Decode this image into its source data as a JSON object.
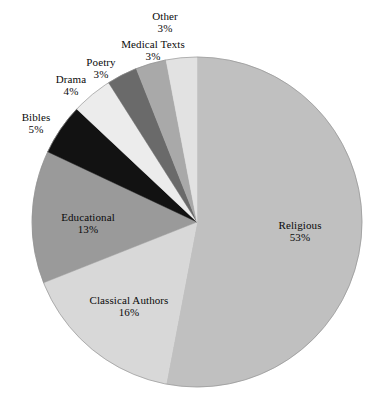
{
  "chart_data": {
    "type": "pie",
    "title": "",
    "subtitle": "",
    "xlabel": "",
    "ylabel": "",
    "legend_position": "none",
    "grid": false,
    "labels_show_percent": true,
    "start_angle_deg": 0,
    "direction": "clockwise",
    "categories": [
      "Religious",
      "Classical Authors",
      "Educational",
      "Bibles",
      "Drama",
      "Poetry",
      "Medical Texts",
      "Other"
    ],
    "values": [
      53,
      16,
      13,
      5,
      4,
      3,
      3,
      3
    ],
    "value_labels": [
      "53%",
      "16%",
      "13%",
      "5%",
      "4%",
      "3%",
      "3%",
      "3%"
    ],
    "colors": [
      "#c0c0c0",
      "#d8d8d8",
      "#9a9a9a",
      "#121212",
      "#ececec",
      "#6a6a6a",
      "#a9a9a9",
      "#e2e2e2"
    ],
    "slices": [
      {
        "name": "Religious",
        "value": 53,
        "value_label": "53%",
        "color": "#c0c0c0"
      },
      {
        "name": "Classical Authors",
        "value": 16,
        "value_label": "16%",
        "color": "#d8d8d8"
      },
      {
        "name": "Educational",
        "value": 13,
        "value_label": "13%",
        "color": "#9a9a9a"
      },
      {
        "name": "Bibles",
        "value": 5,
        "value_label": "5%",
        "color": "#121212"
      },
      {
        "name": "Drama",
        "value": 4,
        "value_label": "4%",
        "color": "#ececec"
      },
      {
        "name": "Poetry",
        "value": 3,
        "value_label": "3%",
        "color": "#6a6a6a"
      },
      {
        "name": "Medical Texts",
        "value": 3,
        "value_label": "3%",
        "color": "#a9a9a9"
      },
      {
        "name": "Other",
        "value": 3,
        "value_label": "3%",
        "color": "#e2e2e2"
      }
    ]
  },
  "geometry": {
    "center_x": 197,
    "center_y": 222,
    "radius": 165,
    "outline_color": "#8a8a8a",
    "background": "#ffffff"
  }
}
